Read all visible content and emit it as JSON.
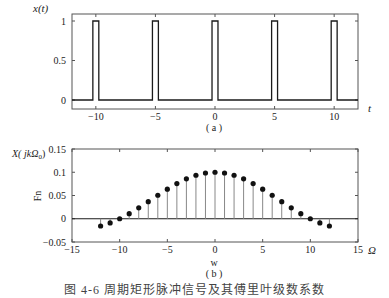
{
  "chart_data": [
    {
      "type": "line",
      "subtitle": "(a)",
      "title": "",
      "xlabel": "t",
      "ylabel": "x(t)",
      "xlim": [
        -12,
        12
      ],
      "ylim": [
        -0.1,
        1.1
      ],
      "xticks": [
        -10,
        -5,
        0,
        5,
        10
      ],
      "xtick_labels": [
        "−10",
        "−5",
        "0",
        "5",
        "10"
      ],
      "yticks": [
        0,
        0.5,
        1
      ],
      "ytick_labels": [
        "0",
        "0.5",
        "1"
      ],
      "grid": false,
      "description": "Periodic rectangular pulse train, period 5, pulse width 0.5, amplitude 1",
      "period": 5,
      "pulse_width": 0.5,
      "amplitude": 1,
      "pulse_centers": [
        -10,
        -5,
        0,
        5,
        10
      ]
    },
    {
      "type": "stem",
      "subtitle": "(b)",
      "title": "",
      "xlabel": "w",
      "xlabel_right": "Ω",
      "ylabel": "Fn",
      "ylabel_top": "X( jkΩ0)",
      "xlim": [
        -15,
        15
      ],
      "ylim": [
        -0.05,
        0.15
      ],
      "xticks": [
        -15,
        -10,
        -5,
        0,
        5,
        10,
        15
      ],
      "xtick_labels": [
        "−15",
        "−10",
        "−5",
        "0",
        "5",
        "10",
        "15"
      ],
      "yticks": [
        -0.05,
        0,
        0.05,
        0.1,
        0.15
      ],
      "ytick_labels": [
        "−0.05",
        "0",
        "0.05",
        "0.1",
        "0.15"
      ],
      "grid": false,
      "x": [
        -12,
        -11,
        -10,
        -9,
        -8,
        -7,
        -6,
        -5,
        -4,
        -3,
        -2,
        -1,
        0,
        1,
        2,
        3,
        4,
        5,
        6,
        7,
        8,
        9,
        10,
        11,
        12
      ],
      "values": [
        -0.0156,
        -0.0089,
        0.0,
        0.0109,
        0.0234,
        0.0368,
        0.0505,
        0.0637,
        0.0757,
        0.0858,
        0.0935,
        0.0984,
        0.1,
        0.0984,
        0.0935,
        0.0858,
        0.0757,
        0.0637,
        0.0505,
        0.0368,
        0.0234,
        0.0109,
        0.0,
        -0.0089,
        -0.0156
      ]
    }
  ],
  "labels": {
    "top_ylabel": "x(t)",
    "top_xlabel": "t",
    "top_caption": "( a )",
    "bottom_ylabel_top": "X( jkΩ",
    "bottom_ylabel_sub": "0",
    "bottom_ylabel_close": ")",
    "bottom_ylabel_side": "Fn",
    "bottom_xlabel": "w",
    "bottom_xlabel_right": "Ω",
    "bottom_caption": "( b )",
    "figure_caption": "图 4-6  周期矩形脉冲信号及其傅里叶级数系数"
  },
  "colors": {
    "axis": "#555555",
    "line": "#1a1a1a",
    "stem": "#888888",
    "marker": "#111111"
  }
}
